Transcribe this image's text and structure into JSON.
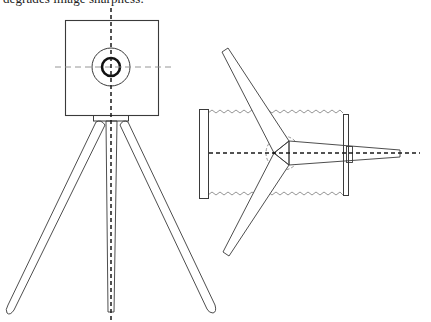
{
  "caption": {
    "text": "degrades image sharpness."
  },
  "figures": [
    {
      "id": "camera-on-tripod-front-view",
      "description": "Front elevation of a box camera with a circular lens mounted on a three-legged tripod; dashed center lines through lens axis",
      "components": [
        "camera-body",
        "lens-outer-ring",
        "lens-inner-ring",
        "horizontal-center-line",
        "vertical-center-line",
        "tripod-head",
        "tripod-leg-left",
        "tripod-leg-center",
        "tripod-leg-right"
      ]
    },
    {
      "id": "tripod-top-view-schematic",
      "description": "Plan view showing three tripod legs radiating from a central point, a dashed circle around the head, front and rear plates connected by zig-zag (bellows) lines, and a tapered extension with dashed optical axis",
      "components": [
        "front-plate",
        "rear-plate",
        "bellows-top",
        "bellows-bottom",
        "leg-upper",
        "leg-lower",
        "leg-right-tapered",
        "head-circle",
        "optical-axis",
        "collar"
      ]
    }
  ],
  "colors": {
    "line": "#3a3a3a",
    "thin_line": "#555555",
    "dashed_light": "#8a8a8a",
    "background": "#ffffff"
  }
}
